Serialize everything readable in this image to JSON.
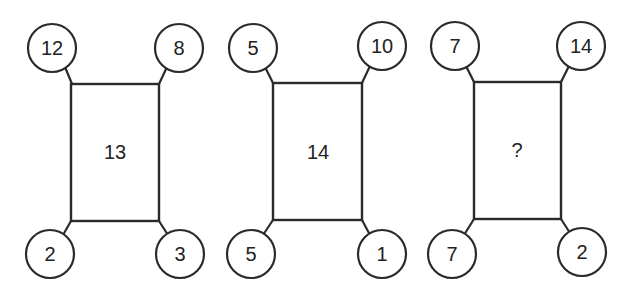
{
  "puzzle": {
    "figures": [
      {
        "center": "13",
        "top_left": "12",
        "top_right": "8",
        "bottom_left": "2",
        "bottom_right": "3"
      },
      {
        "center": "14",
        "top_left": "5",
        "top_right": "10",
        "bottom_left": "5",
        "bottom_right": "1"
      },
      {
        "center": "?",
        "top_left": "7",
        "top_right": "14",
        "bottom_left": "7",
        "bottom_right": "2"
      }
    ]
  }
}
